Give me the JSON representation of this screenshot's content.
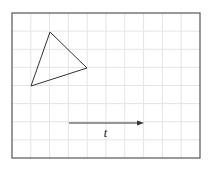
{
  "diagram": {
    "grid": {
      "x0": 12,
      "y0": 13,
      "x1": 200,
      "y1": 158,
      "cols": 10,
      "rows": 8,
      "grid_color": "#e4e4e4",
      "border_color": "#555555"
    },
    "triangle": {
      "points": [
        [
          50,
          32
        ],
        [
          87,
          68
        ],
        [
          31,
          86
        ]
      ],
      "stroke": "#333333"
    },
    "vector": {
      "x1": 69,
      "y1": 123,
      "x2": 144,
      "y2": 123,
      "label": "t",
      "stroke": "#333333"
    }
  }
}
